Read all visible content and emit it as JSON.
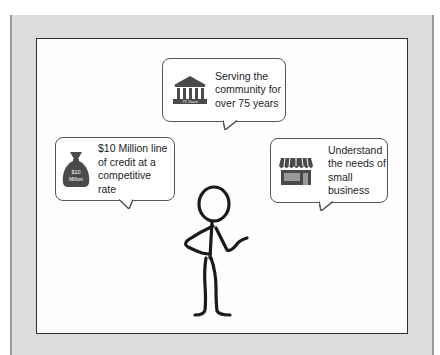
{
  "diagram": {
    "bubbles": [
      {
        "id": "top",
        "icon": "bank-building-icon",
        "icon_label": "75 Years",
        "text": "Serving the\ncommunity for\nover 75 years"
      },
      {
        "id": "left",
        "icon": "money-bag-icon",
        "icon_label_line1": "$10",
        "icon_label_line2": "Million",
        "text": "$10 Million line\nof credit at a\ncompetitive\nrate"
      },
      {
        "id": "right",
        "icon": "storefront-icon",
        "text": "Understand\nthe needs of\nsmall\nbusiness"
      }
    ],
    "figure": "stick-figure-presenter",
    "colors": {
      "outer_panel": "#dcdcdc",
      "inner_frame_border": "#2e2e2e",
      "bubble_border": "#555555",
      "icon_fill": "#4a4a4a",
      "text": "#1e1e1e"
    }
  }
}
